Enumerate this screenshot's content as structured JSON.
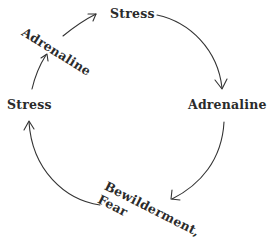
{
  "diagram": {
    "type": "cycle",
    "nodes": [
      {
        "id": "stress-top",
        "label": "Stress"
      },
      {
        "id": "adrenaline-right",
        "label": "Adrenaline"
      },
      {
        "id": "bewilderment-fear",
        "label_line1": "Bewilderment,",
        "label_line2": "Fear"
      },
      {
        "id": "stress-left",
        "label": "Stress"
      },
      {
        "id": "adrenaline-upper-left",
        "label": "Adrenaline"
      }
    ],
    "edges": [
      {
        "from": "stress-top",
        "to": "adrenaline-right"
      },
      {
        "from": "adrenaline-right",
        "to": "bewilderment-fear"
      },
      {
        "from": "bewilderment-fear",
        "to": "stress-left"
      },
      {
        "from": "stress-left",
        "to": "adrenaline-upper-left"
      },
      {
        "from": "adrenaline-upper-left",
        "to": "stress-top"
      }
    ],
    "colors": {
      "text": "#2b2b2b",
      "stroke": "#333333",
      "background": "#ffffff"
    }
  }
}
